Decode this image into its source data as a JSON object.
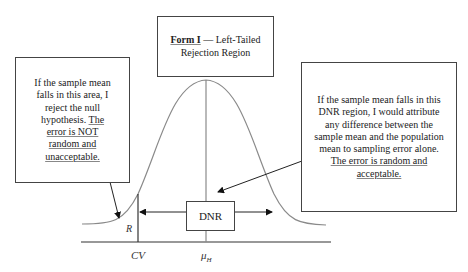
{
  "title_box": {
    "form_label": "Form I",
    "dash": " — ",
    "text": "Left-Tailed Rejection Region"
  },
  "left_box": {
    "text": "If the sample mean falls in this area, I reject the null hypothesis.",
    "underlined": "The error is NOT random and unacceptable."
  },
  "right_box": {
    "text": "If the sample mean falls in this DNR region, I would attribute any difference between the sample mean and the population mean to sampling error alone.",
    "underlined_1": "The error is random and",
    "underlined_2": "acceptable."
  },
  "dnr_box": {
    "label": "DNR"
  },
  "axis_labels": {
    "rejection_region": "R",
    "critical_value": "CV",
    "mu": "μ",
    "mu_sub": "H"
  },
  "colors": {
    "curve": "#8a8a8a",
    "lines": "#333333",
    "box_border": "#444444"
  }
}
